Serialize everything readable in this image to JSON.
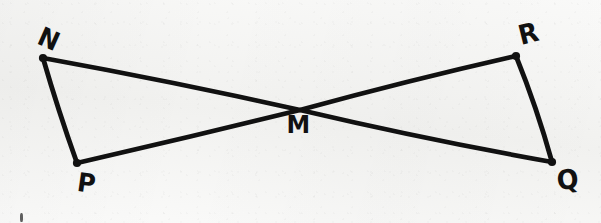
{
  "figure": {
    "background_color": "#f5f5f3",
    "ink_color": "#111111",
    "width": 601,
    "height": 223,
    "points": [
      {
        "id": "N",
        "label": "N",
        "x": 43,
        "y": 58,
        "label_x": 38,
        "label_y": 26,
        "label_rotate": 24,
        "label_size": 26
      },
      {
        "id": "P",
        "label": "P",
        "x": 77,
        "y": 163,
        "label_x": 77,
        "label_y": 170,
        "label_rotate": 8,
        "label_size": 26
      },
      {
        "id": "M",
        "label": "M",
        "x": 300,
        "y": 110,
        "label_x": 286,
        "label_y": 112,
        "label_rotate": 0,
        "label_size": 25
      },
      {
        "id": "R",
        "label": "R",
        "x": 516,
        "y": 56,
        "label_x": 518,
        "label_y": 20,
        "label_rotate": -14,
        "label_size": 27
      },
      {
        "id": "Q",
        "label": "Q",
        "x": 552,
        "y": 162,
        "label_x": 556,
        "label_y": 166,
        "label_rotate": -6,
        "label_size": 27
      }
    ],
    "segments": [
      {
        "id": "NQ",
        "from": "N",
        "to": "Q",
        "path": "M 43 58 Q 175 82 300 110 Q 428 140 552 162",
        "stroke_width": 4.6
      },
      {
        "id": "PR",
        "from": "P",
        "to": "R",
        "path": "M 77 163 Q 190 137 300 110 Q 410 80 516 56",
        "stroke_width": 4.6
      },
      {
        "id": "NP",
        "from": "N",
        "to": "P",
        "path": "M 43 58 Q 58 110 77 163",
        "stroke_width": 4.8
      },
      {
        "id": "RQ",
        "from": "R",
        "to": "Q",
        "path": "M 516 56 Q 537 108 552 162",
        "stroke_width": 4.8
      }
    ],
    "stray_marks": [
      {
        "id": "bottom-left-tick",
        "x": 20,
        "y": 213,
        "width": 3,
        "height": 9
      }
    ]
  }
}
